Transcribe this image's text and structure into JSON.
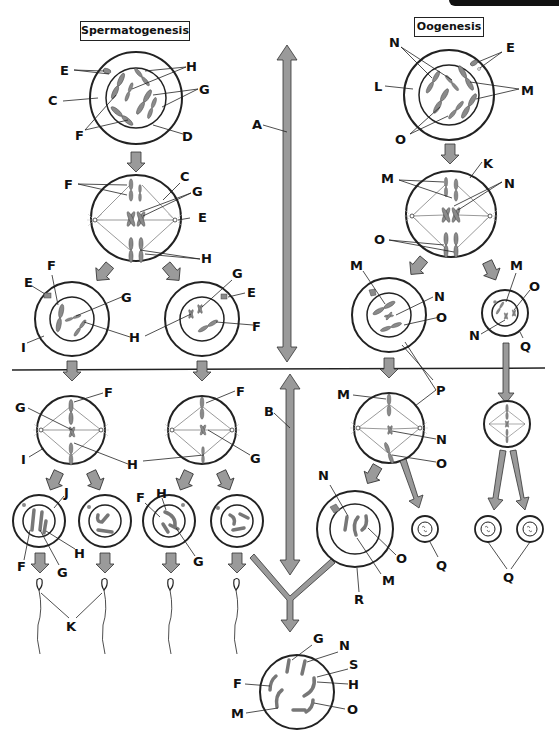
{
  "titles": {
    "left": "Spermatogenesis",
    "right": "Oogenesis"
  },
  "colors": {
    "arrow_fill": "#9a9a9a",
    "outline": "#1a1a1a",
    "chromosome": "#8a8a8a",
    "background": "#ffffff"
  },
  "labels": {
    "sperm_primary": {
      "E": "E",
      "H": "H",
      "C": "C",
      "G": "G",
      "F": "F",
      "D": "D"
    },
    "sperm_meiosis1": {
      "F": "F",
      "C": "C",
      "G": "G",
      "E": "E",
      "H": "H"
    },
    "sperm_secondary_left": {
      "E": "E",
      "F": "F",
      "G": "G",
      "I": "I",
      "H": "H"
    },
    "sperm_secondary_right": {
      "G": "G",
      "E": "E",
      "F": "F"
    },
    "sperm_meiosis2_left": {
      "G": "G",
      "F": "F",
      "I": "I",
      "H": "H"
    },
    "sperm_meiosis2_right": {
      "F": "F",
      "G": "G"
    },
    "spermatids": {
      "J": "J",
      "F": "F",
      "G": "G",
      "H": "H",
      "F2": "F",
      "H2": "H",
      "G2": "G"
    },
    "sperm": {
      "K": "K"
    },
    "axis": {
      "A": "A",
      "B": "B"
    },
    "oo_primary": {
      "N": "N",
      "E": "E",
      "L": "L",
      "M": "M",
      "O": "O"
    },
    "oo_meiosis1": {
      "M": "M",
      "K": "K",
      "N": "N",
      "O": "O"
    },
    "oo_secondary": {
      "M": "M",
      "N": "N",
      "O": "O"
    },
    "oo_polar1": {
      "M": "M",
      "O": "O",
      "N": "N",
      "Q": "Q"
    },
    "oo_meiosis2": {
      "M": "M",
      "P": "P",
      "N": "N",
      "O": "O"
    },
    "ootid": {
      "N": "N",
      "O": "O",
      "M": "M",
      "R": "R",
      "Q": "Q"
    },
    "polar_bodies": {
      "Q": "Q"
    },
    "zygote": {
      "G": "G",
      "N": "N",
      "S": "S",
      "F": "F",
      "H": "H",
      "M": "M",
      "O": "O"
    }
  }
}
